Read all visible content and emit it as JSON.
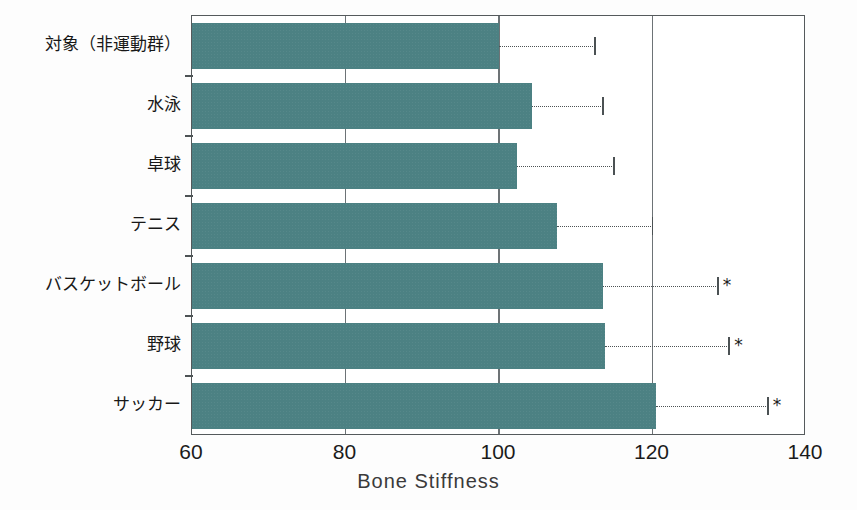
{
  "chart_data": {
    "type": "bar",
    "orientation": "horizontal",
    "title": "",
    "xlabel": "Bone Stiffness",
    "ylabel": "",
    "xlim": [
      60,
      140
    ],
    "xticks": [
      60,
      80,
      100,
      120,
      140
    ],
    "xtick_labels": [
      "60",
      "80",
      "100",
      "120",
      "140"
    ],
    "grid": "vertical-at-xticks",
    "legend": "none",
    "bar_color": "#4c8183",
    "categories": [
      "対象（非運動群）",
      "水泳",
      "卓球",
      "テニス",
      "バスケットボール",
      "野球",
      "サッカー"
    ],
    "values": [
      100.0,
      104.3,
      102.3,
      107.5,
      113.5,
      113.8,
      120.5
    ],
    "error_upper": [
      112.5,
      113.5,
      115.0,
      120.0,
      128.5,
      130.0,
      135.0
    ],
    "significance": [
      "",
      "",
      "",
      "",
      "*",
      "*",
      "*"
    ],
    "significance_marker": "*"
  },
  "axis": {
    "xtitle": "Bone Stiffness",
    "ticks": [
      {
        "label": "60",
        "value": 60
      },
      {
        "label": "80",
        "value": 80
      },
      {
        "label": "100",
        "value": 100
      },
      {
        "label": "120",
        "value": 120
      },
      {
        "label": "140",
        "value": 140
      }
    ]
  }
}
